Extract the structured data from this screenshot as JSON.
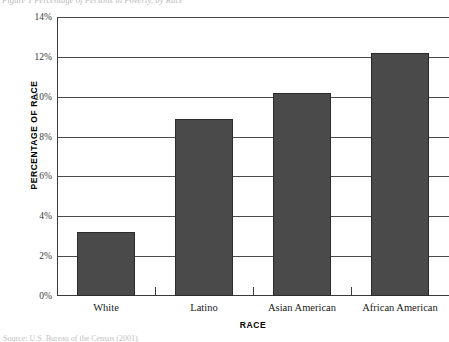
{
  "figure": {
    "top_caption": "Figure 1  Percentage of Persons in Poverty, by Race",
    "source_note": "Source: U.S. Bureau of the Census (2001)."
  },
  "chart_data": {
    "type": "bar",
    "title": "",
    "xlabel": "RACE",
    "ylabel": "PERCENTAGE OF RACE",
    "categories": [
      "White",
      "Latino",
      "Asian American",
      "African American"
    ],
    "values": [
      3.2,
      8.9,
      10.2,
      12.2
    ],
    "value_labels": [
      "3.2%",
      "8.9%",
      "10.2%",
      "12.2%"
    ],
    "ylim": [
      0,
      14
    ],
    "ytick_values": [
      0,
      2,
      4,
      6,
      8,
      10,
      12,
      14
    ],
    "ytick_labels": [
      "0%",
      "2%",
      "4%",
      "6%",
      "8%",
      "10%",
      "12%",
      "14%"
    ],
    "grid": true,
    "legend": false,
    "bar_color": "#4a4a4a",
    "bar_border_color": "#2c2c2c",
    "axis_color": "#3a3a3a",
    "background": "#ffffff"
  }
}
